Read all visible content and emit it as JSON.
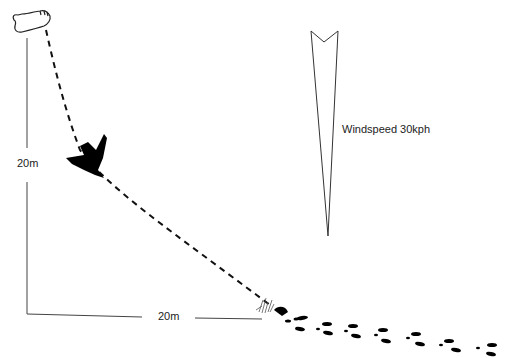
{
  "diagram": {
    "height_label": "20m",
    "distance_label": "20m",
    "wind_label": "Windspeed 30kph",
    "icons": [
      "foot-icon",
      "bird-icon",
      "wind-arrow-icon",
      "grass-landing-icon",
      "footprint-trail-icon"
    ],
    "colors": {
      "ink": "#111111",
      "line": "#333333",
      "background": "#ffffff"
    }
  }
}
